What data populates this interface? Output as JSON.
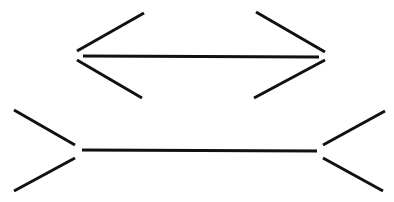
{
  "diagram": {
    "type": "muller-lyer-illusion",
    "background": "#ffffff",
    "stroke_color": "#111111",
    "figures": [
      {
        "name": "top-figure-arrowheads-inward",
        "shaft": [
          83,
          56,
          319,
          57
        ],
        "fins": [
          [
            77,
            51,
            144,
            13
          ],
          [
            77,
            60,
            142,
            98
          ],
          [
            256,
            12,
            325,
            52
          ],
          [
            325,
            60,
            254,
            98
          ]
        ]
      },
      {
        "name": "bottom-figure-arrowheads-outward",
        "shaft": [
          82,
          150,
          317,
          151
        ],
        "fins": [
          [
            14,
            110,
            75,
            145
          ],
          [
            75,
            158,
            14,
            191
          ],
          [
            323,
            145,
            385,
            111
          ],
          [
            323,
            158,
            383,
            191
          ]
        ]
      }
    ]
  }
}
